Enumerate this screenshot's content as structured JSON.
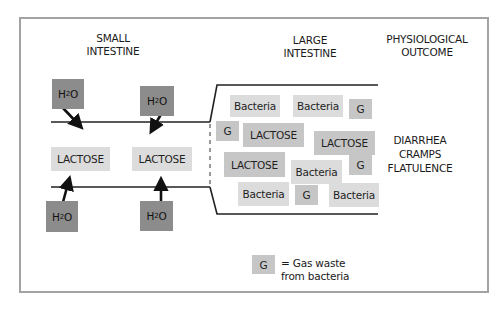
{
  "headers": {
    "small_intestine": [
      "SMALL",
      "INTESTINE"
    ],
    "large_intestine": [
      "LARGE",
      "INTESTINE"
    ],
    "physiological_outcome": [
      "PHYSIOLOGICAL",
      "OUTCOME"
    ]
  },
  "small_intestine": {
    "water_top": [
      {
        "label_main": "H",
        "label_sub": "2",
        "label_end": "O"
      },
      {
        "label_main": "H",
        "label_sub": "2",
        "label_end": "O"
      }
    ],
    "lactose": [
      "LACTOSE",
      "LACTOSE"
    ],
    "water_bottom": [
      {
        "label_main": "H",
        "label_sub": "2",
        "label_end": "O"
      },
      {
        "label_main": "H",
        "label_sub": "2",
        "label_end": "O"
      }
    ]
  },
  "large_intestine": {
    "items": [
      {
        "label": "Bacteria",
        "type": "bacteria"
      },
      {
        "label": "Bacteria",
        "type": "bacteria"
      },
      {
        "label": "G",
        "type": "gas"
      },
      {
        "label": "G",
        "type": "gas"
      },
      {
        "label": "LACTOSE",
        "type": "lactose"
      },
      {
        "label": "LACTOSE",
        "type": "lactose"
      },
      {
        "label": "LACTOSE",
        "type": "lactose"
      },
      {
        "label": "Bacteria",
        "type": "bacteria"
      },
      {
        "label": "G",
        "type": "gas"
      },
      {
        "label": "Bacteria",
        "type": "bacteria"
      },
      {
        "label": "G",
        "type": "gas"
      },
      {
        "label": "Bacteria",
        "type": "bacteria"
      }
    ]
  },
  "outcome": [
    "DIARRHEA",
    "CRAMPS",
    "FLATULENCE"
  ],
  "legend": {
    "symbol": "G",
    "text_line1": "= Gas waste",
    "text_line2": "from bacteria"
  },
  "colors": {
    "water_box": "#8c8c8c",
    "lactose_box": "#c6c6c6",
    "bacteria_box": "#dcdcdc",
    "frame": "#a3a3a3"
  }
}
